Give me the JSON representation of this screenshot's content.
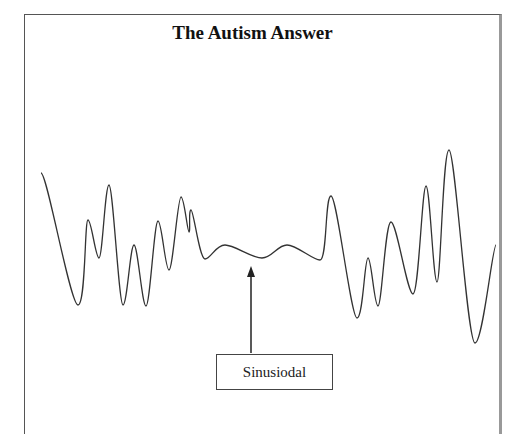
{
  "diagram": {
    "title": "The Autism Answer",
    "label": "Sinusiodal",
    "colors": {
      "line": "#333333",
      "frame": "#555555",
      "background": "#ffffff"
    },
    "waveform_points": [
      [
        41,
        173
      ],
      [
        78,
        305
      ],
      [
        88,
        220
      ],
      [
        99,
        258
      ],
      [
        109,
        185
      ],
      [
        123,
        305
      ],
      [
        134,
        245
      ],
      [
        146,
        306
      ],
      [
        158,
        221
      ],
      [
        169,
        270
      ],
      [
        181,
        197
      ],
      [
        189,
        232
      ],
      [
        191,
        210
      ],
      [
        205,
        259
      ],
      [
        225,
        245
      ],
      [
        262,
        258
      ],
      [
        287,
        245
      ],
      [
        320,
        260
      ],
      [
        331,
        196
      ],
      [
        357,
        318
      ],
      [
        368,
        258
      ],
      [
        378,
        306
      ],
      [
        391,
        222
      ],
      [
        413,
        294
      ],
      [
        426,
        186
      ],
      [
        437,
        282
      ],
      [
        449,
        150
      ],
      [
        475,
        343
      ],
      [
        496,
        245
      ]
    ],
    "arrow": {
      "x": 251,
      "tip_y": 266,
      "base_y": 353
    }
  }
}
